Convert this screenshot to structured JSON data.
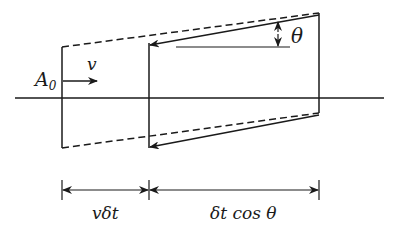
{
  "diagram": {
    "labels": {
      "area": "A",
      "area_sub": "0",
      "velocity": "v",
      "angle": "θ",
      "left_dimension": "vδt",
      "right_dimension": "δt cos θ"
    },
    "colors": {
      "stroke": "#1a1a1a",
      "background": "#ffffff"
    }
  }
}
